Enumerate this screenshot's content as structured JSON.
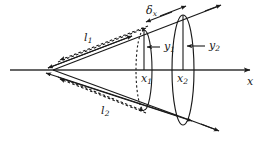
{
  "figure": {
    "stroke_color": "#1a1a1a",
    "axis_color": "#333333",
    "background": "#ffffff"
  },
  "labels": {
    "slant_upper": {
      "base": "l",
      "sub": "1"
    },
    "slant_lower": {
      "base": "l",
      "sub": "2"
    },
    "delta": {
      "base": "δ",
      "sub": "x"
    },
    "radius_near": {
      "base": "y",
      "sub": "1"
    },
    "radius_far": {
      "base": "y",
      "sub": "2"
    },
    "station_near": {
      "base": "x",
      "sub": "1"
    },
    "station_far": {
      "base": "x",
      "sub": "2"
    },
    "axis": {
      "base": "x",
      "sub": ""
    }
  },
  "geometry": {
    "apex": {
      "x": 53,
      "y": 70
    },
    "axis_line": {
      "x1": 10,
      "y1": 70,
      "x2": 252,
      "y2": 70
    },
    "ellipse_near": {
      "cx": 144,
      "cy": 70,
      "rx": 8,
      "ry": 40
    },
    "ellipse_far": {
      "cx": 183,
      "cy": 70,
      "rx": 11,
      "ry": 55
    },
    "cone_edge_upper": {
      "x1": 53,
      "y1": 70,
      "x2": 219,
      "y2": 6
    },
    "cone_edge_lower": {
      "x1": 53,
      "y1": 70,
      "x2": 217,
      "y2": 130
    }
  }
}
